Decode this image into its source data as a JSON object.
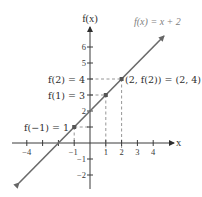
{
  "diagram": {
    "y_axis_label": "f(x)",
    "x_axis_label": "x",
    "function_label": "f(x) = x + 2",
    "x_ticks": [
      {
        "value": -4,
        "label": "−4"
      },
      {
        "value": -3,
        "label": ""
      },
      {
        "value": -2,
        "label": ""
      },
      {
        "value": -1,
        "label": "−1"
      },
      {
        "value": 1,
        "label": "1"
      },
      {
        "value": 2,
        "label": "2"
      },
      {
        "value": 3,
        "label": "3"
      },
      {
        "value": 4,
        "label": "4"
      }
    ],
    "y_ticks": [
      {
        "value": 6,
        "label": "6"
      },
      {
        "value": 5,
        "label": "5"
      },
      {
        "value": 4,
        "label": ""
      },
      {
        "value": 3,
        "label": ""
      },
      {
        "value": 2,
        "label": "2"
      },
      {
        "value": 1,
        "label": ""
      },
      {
        "value": -1,
        "label": "−1"
      },
      {
        "value": -2,
        "label": "−2"
      }
    ],
    "annotations": {
      "f2": "f(2) = 4",
      "f1": "f(1) = 3",
      "fm1": "f(−1) = 1",
      "point_2_4": "(2, f(2)) = (2, 4)"
    },
    "highlighted_points": [
      {
        "x": -1,
        "y": 1
      },
      {
        "x": 1,
        "y": 3
      },
      {
        "x": 2,
        "y": 4
      }
    ],
    "line": {
      "slope": 1,
      "intercept": 2,
      "x_range": [
        -4.5,
        4.7
      ]
    },
    "colors": {
      "axes": "#3a3a3a",
      "line": "#6a6a6a",
      "dashes": "#8a8a8a",
      "function_label": "#808080"
    }
  }
}
